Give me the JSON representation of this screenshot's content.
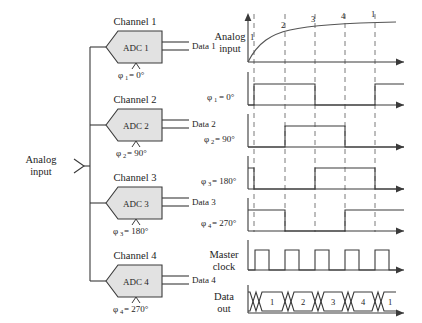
{
  "diagram": {
    "left": {
      "analog_input_label_line1": "Analog",
      "analog_input_label_line2": "input",
      "channels": [
        {
          "channel_label": "Channel 1",
          "adc_label": "ADC 1",
          "data_label": "Data 1",
          "phase_symbol": "φ",
          "phase_index": "1",
          "phase_value": "= 0°"
        },
        {
          "channel_label": "Channel 2",
          "adc_label": "ADC 2",
          "data_label": "Data 2",
          "phase_symbol": "φ",
          "phase_index": "2",
          "phase_value": "= 90°"
        },
        {
          "channel_label": "Channel 3",
          "adc_label": "ADC 3",
          "data_label": "Data 3",
          "phase_symbol": "φ",
          "phase_index": "3",
          "phase_value": "= 180°"
        },
        {
          "channel_label": "Channel 4",
          "adc_label": "ADC 4",
          "data_label": "Data 4",
          "phase_symbol": "φ",
          "phase_index": "4",
          "phase_value": "= 270°"
        }
      ]
    },
    "right": {
      "rows": [
        {
          "name": "analog-input",
          "label_line1": "Analog",
          "label_line2": "input",
          "type": "curve"
        },
        {
          "name": "phi1",
          "label_line1": "φ",
          "label_sub": "1",
          "label_line2": "= 0°",
          "type": "digital"
        },
        {
          "name": "phi2",
          "label_line1": "φ",
          "label_sub": "2",
          "label_line2": "= 90°",
          "type": "digital"
        },
        {
          "name": "phi3",
          "label_line1": "φ",
          "label_sub": "3",
          "label_line2": "= 180°",
          "type": "digital"
        },
        {
          "name": "phi4",
          "label_line1": "φ",
          "label_sub": "4",
          "label_line2": "= 270°",
          "type": "digital"
        },
        {
          "name": "master-clock",
          "label_line1": "Master",
          "label_line2": "clock",
          "type": "clock"
        },
        {
          "name": "data-out",
          "label_line1": "Data",
          "label_line2": "out",
          "type": "bus"
        }
      ],
      "sample_markers": [
        "1",
        "2",
        "3",
        "4",
        "1"
      ],
      "data_out_values": [
        "1",
        "2",
        "3",
        "4",
        "1"
      ]
    }
  },
  "colors": {
    "line": "#3a3a3a",
    "adc_fill": "#e2e2e2",
    "curve": "#555555",
    "dash": "#6b6b6b",
    "text": "#242424"
  }
}
